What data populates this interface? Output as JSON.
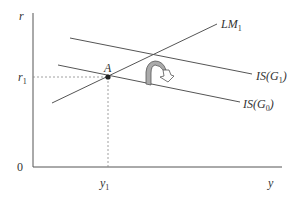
{
  "diagram": {
    "type": "IS-LM diagram",
    "axes": {
      "y_axis_label": "r",
      "x_axis_label": "y",
      "origin_label": "0"
    },
    "ticks": {
      "r_tick": {
        "base": "r",
        "sub": "1"
      },
      "y_tick": {
        "base": "y",
        "sub": "1"
      }
    },
    "curves": [
      {
        "name": "LM",
        "sub": "1",
        "label_suffix": ""
      },
      {
        "name": "IS(G",
        "sub": "1",
        "label_suffix": ")"
      },
      {
        "name": "IS(G",
        "sub": "0",
        "label_suffix": ")"
      }
    ],
    "equilibrium_point": {
      "label": "A"
    },
    "colors": {
      "line": "#555555",
      "arrow_fill": "#aaaaaa",
      "dashed": "#888888"
    }
  }
}
